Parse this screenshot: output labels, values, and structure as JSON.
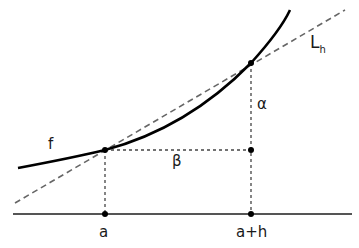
{
  "diagram": {
    "labels": {
      "f": "f",
      "L": "L",
      "L_sub": "h",
      "alpha": "α",
      "beta": "β",
      "a": "a",
      "a_plus_h": "a+h"
    },
    "colors": {
      "curve": "#000000",
      "secant": "#666666",
      "axis": "#555555",
      "guides": "#444444",
      "points": "#000000"
    }
  }
}
